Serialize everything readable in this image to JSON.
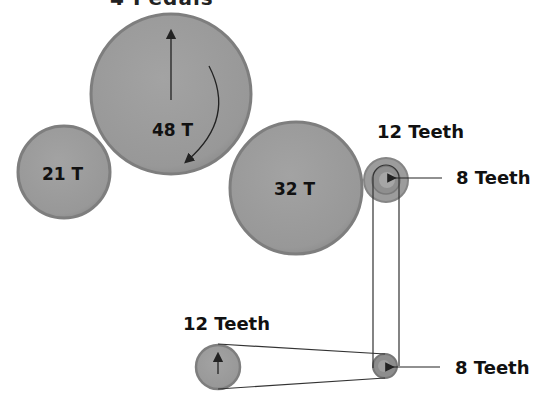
{
  "diagram": {
    "cut_title": "4 Pedals",
    "gears": [
      {
        "id": "gear-48",
        "label": "48 T",
        "cx": 171,
        "cy": 94,
        "r": 80
      },
      {
        "id": "gear-21",
        "label": "21 T",
        "cx": 64,
        "cy": 172,
        "r": 46
      },
      {
        "id": "gear-32",
        "label": "32 T",
        "cx": 296,
        "cy": 188,
        "r": 66
      }
    ],
    "sprockets": [
      {
        "id": "sprocket-12-top",
        "label": "12 Teeth"
      },
      {
        "id": "sprocket-8-top",
        "label": "8 Teeth"
      },
      {
        "id": "sprocket-12-bottom",
        "label": "12 Teeth"
      },
      {
        "id": "sprocket-8-bottom",
        "label": "8 Teeth"
      }
    ],
    "colors": {
      "gear_fill": "#9a9a9a",
      "gear_rim": "#7d7d7d",
      "line": "#222222",
      "background": "#ffffff"
    }
  }
}
